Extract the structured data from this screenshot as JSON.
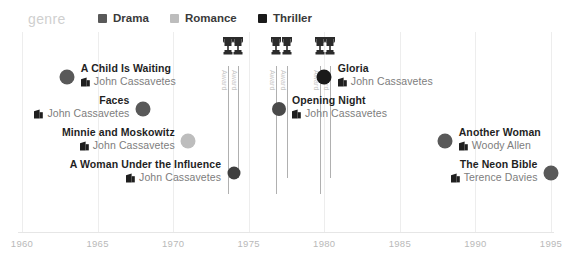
{
  "legend": {
    "title": "genre",
    "items": [
      {
        "label": "Drama",
        "color": "#595959",
        "swatch_icon": "square-swatch"
      },
      {
        "label": "Romance",
        "color": "#bdbdbd",
        "swatch_icon": "square-swatch"
      },
      {
        "label": "Thriller",
        "color": "#1a1a1a",
        "swatch_icon": "square-swatch"
      }
    ]
  },
  "axis": {
    "ticks": [
      "1960",
      "1965",
      "1970",
      "1975",
      "1980",
      "1985",
      "1990",
      "1995"
    ],
    "min": 1960,
    "max": 1995,
    "tick_color": "#b9b9b9"
  },
  "gridlines": [
    1960,
    1965,
    1970,
    1975,
    1980,
    1985,
    1990,
    1995
  ],
  "awards": [
    {
      "label": "Award",
      "year": 1973.6,
      "icon": "trophy-icon"
    },
    {
      "label": "Award",
      "year": 1974.3,
      "icon": "trophy-icon"
    },
    {
      "label": "Award",
      "year": 1976.8,
      "icon": "trophy-icon"
    },
    {
      "label": "Award",
      "year": 1977.5,
      "icon": "trophy-icon"
    },
    {
      "label": "Award",
      "year": 1979.7,
      "icon": "trophy-icon"
    },
    {
      "label": "Award",
      "year": 1980.4,
      "icon": "trophy-icon"
    }
  ],
  "chart_data": {
    "type": "scatter",
    "title": "genre",
    "xlabel": "",
    "ylabel": "",
    "xlim": [
      1960,
      1995
    ],
    "grid": true,
    "legend_position": "top",
    "series": [
      {
        "name": "Drama",
        "color": "#595959"
      },
      {
        "name": "Romance",
        "color": "#bdbdbd"
      },
      {
        "name": "Thriller",
        "color": "#1a1a1a"
      }
    ],
    "points": [
      {
        "title": "A Child Is Waiting",
        "director": "John Cassavetes",
        "year": 1963,
        "genre": "Drama",
        "color": "#595959",
        "row": 0,
        "label_side": "right",
        "size": 15,
        "awarded": false
      },
      {
        "title": "Faces",
        "director": "John Cassavetes",
        "year": 1968,
        "genre": "Drama",
        "color": "#595959",
        "row": 1,
        "label_side": "left",
        "size": 15,
        "awarded": false
      },
      {
        "title": "Minnie and Moskowitz",
        "director": "John Cassavetes",
        "year": 1971,
        "genre": "Romance",
        "color": "#bdbdbd",
        "row": 2,
        "label_side": "left",
        "size": 15,
        "awarded": false
      },
      {
        "title": "A Woman Under the Influence",
        "director": "John Cassavetes",
        "year": 1974,
        "genre": "Thriller",
        "color": "#3f3f3f",
        "row": 3,
        "label_side": "left",
        "size": 13,
        "awarded": true
      },
      {
        "title": "Gloria",
        "director": "John Cassavetes",
        "year": 1980,
        "genre": "Thriller",
        "color": "#1a1a1a",
        "row": 0,
        "label_side": "right",
        "size": 15,
        "awarded": true
      },
      {
        "title": "Opening Night",
        "director": "John Cassavetes",
        "year": 1977,
        "genre": "Drama",
        "color": "#4a4a4a",
        "row": 1,
        "label_side": "right",
        "size": 14,
        "awarded": true
      },
      {
        "title": "Another Woman",
        "director": "Woody Allen",
        "year": 1988,
        "genre": "Drama",
        "color": "#595959",
        "row": 2,
        "label_side": "right",
        "size": 15,
        "awarded": false
      },
      {
        "title": "The Neon Bible",
        "director": "Terence Davies",
        "year": 1995,
        "genre": "Drama",
        "color": "#595959",
        "row": 3,
        "label_side": "left",
        "size": 15,
        "awarded": false
      }
    ]
  }
}
